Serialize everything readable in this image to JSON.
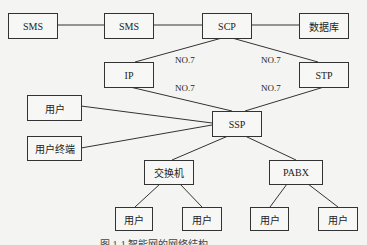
{
  "nodes": {
    "sms1": "SMS",
    "sms2": "SMS",
    "scp": "SCP",
    "db": "数据库",
    "ip": "IP",
    "stp": "STP",
    "user_left": "用户",
    "user_terminal": "用户终端",
    "ssp": "SSP",
    "switch": "交换机",
    "pabx": "PABX",
    "user1": "用户",
    "user2": "用户",
    "user3": "用户",
    "user4": "用户"
  },
  "links": {
    "scp_ip": "NO.7",
    "scp_stp": "NO.7",
    "ip_ssp": "NO.7",
    "stp_ssp": "NO.7"
  },
  "caption": "图 1-1 智能网的网络结构"
}
